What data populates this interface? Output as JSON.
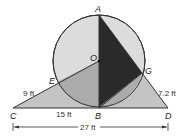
{
  "points": {
    "A": "A",
    "O": "O",
    "B": "B",
    "C": "C",
    "D": "D",
    "E": "E",
    "G": "G"
  },
  "measurements": {
    "CE": "9 ft",
    "CB": "15 ft",
    "GD": "7.2 ft",
    "CD": "27 ft"
  },
  "colors": {
    "circle_fill": "#dcdcdc",
    "triangle_fill": "#c4c4c4",
    "overlap_fill": "#a9a9a9",
    "dark_fill": "#2a2a2a",
    "stroke": "#333333"
  }
}
